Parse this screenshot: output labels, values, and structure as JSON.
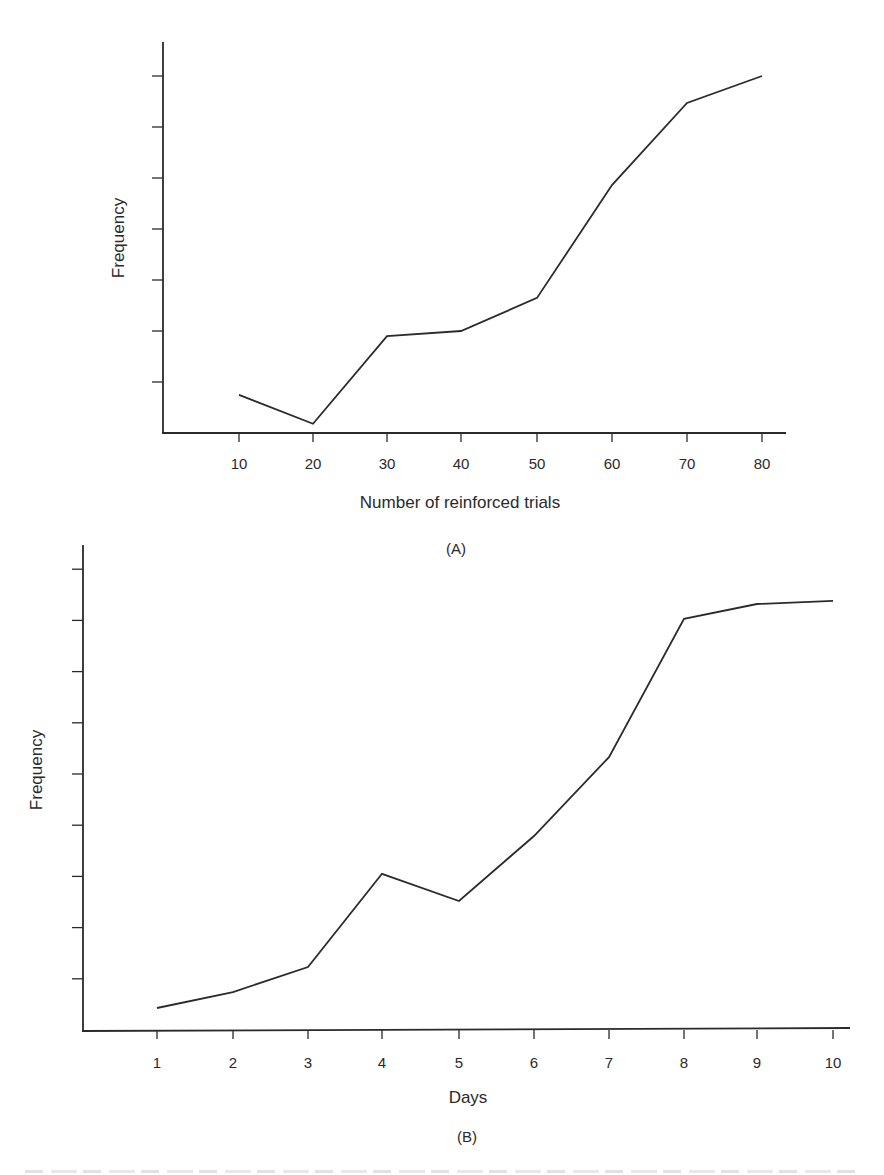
{
  "figure": {
    "caption_cutoff": "",
    "panels": [
      "(A)",
      "(B)"
    ]
  },
  "chart_data": [
    {
      "type": "line",
      "panel": "(A)",
      "title": "",
      "xlabel": "Number of reinforced trials",
      "ylabel": "Frequency",
      "x": [
        10,
        20,
        30,
        40,
        50,
        60,
        70,
        80
      ],
      "x_tick_labels": [
        "10",
        "20",
        "30",
        "40",
        "50",
        "60",
        "70",
        "80"
      ],
      "y_ticks_count": 7,
      "y_tick_labels": [],
      "y_units": "tick intervals (unlabeled)",
      "series": [
        {
          "name": "Frequency",
          "values": [
            0.75,
            0.18,
            1.9,
            2.0,
            2.65,
            4.86,
            6.47,
            7.0
          ]
        }
      ],
      "ylim": [
        0,
        7.6
      ],
      "grid": false,
      "legend": null
    },
    {
      "type": "line",
      "panel": "(B)",
      "title": "",
      "xlabel": "Days",
      "ylabel": "Frequency",
      "x": [
        1,
        2,
        3,
        4,
        5,
        6,
        7,
        8,
        9,
        10
      ],
      "x_tick_labels": [
        "1",
        "2",
        "3",
        "4",
        "5",
        "6",
        "7",
        "8",
        "9",
        "10"
      ],
      "y_ticks_count": 9,
      "y_tick_labels": [],
      "y_units": "tick intervals (unlabeled)",
      "series": [
        {
          "name": "Frequency",
          "values": [
            0.43,
            0.74,
            1.23,
            3.05,
            2.52,
            3.79,
            5.33,
            8.03,
            8.32,
            8.38
          ]
        }
      ],
      "ylim": [
        0,
        9.5
      ],
      "grid": false,
      "legend": null
    }
  ]
}
